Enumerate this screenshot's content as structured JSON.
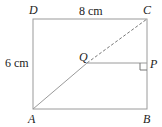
{
  "diagram": {
    "type": "geometry",
    "shape": "rectangle ABCD with diagonal AC and perpendicular QP to BC",
    "points": {
      "A": {
        "label": "A",
        "x": 33,
        "y": 109
      },
      "B": {
        "label": "B",
        "x": 147,
        "y": 109
      },
      "C": {
        "label": "C",
        "x": 147,
        "y": 19
      },
      "D": {
        "label": "D",
        "x": 33,
        "y": 19
      },
      "Q": {
        "label": "Q",
        "x": 87,
        "y": 63
      },
      "P": {
        "label": "P",
        "x": 147,
        "y": 63
      }
    },
    "dimensions": {
      "top": "8 cm",
      "left": "6 cm"
    },
    "segments": [
      {
        "from": "A",
        "to": "Q",
        "style": "solid"
      },
      {
        "from": "Q",
        "to": "C",
        "style": "dashed"
      },
      {
        "from": "Q",
        "to": "P",
        "style": "solid"
      }
    ],
    "right_angle_at": "P",
    "colors": {
      "line": "#999999",
      "text": "#222222"
    }
  }
}
